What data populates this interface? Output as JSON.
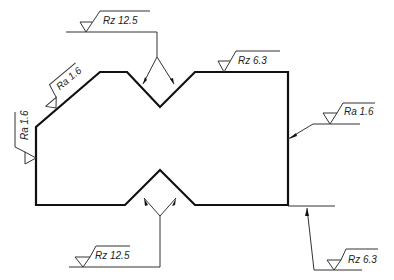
{
  "drawing": {
    "type": "surface roughness annotation drawing",
    "annotations": [
      {
        "id": "top-center",
        "label": "Rz 12.5"
      },
      {
        "id": "top-right-edge",
        "label": "Rz 6.3"
      },
      {
        "id": "left-chamfer",
        "label": "Ra 1.6"
      },
      {
        "id": "left-side",
        "label": "Ra 1.6"
      },
      {
        "id": "right-side",
        "label": "Ra 1.6"
      },
      {
        "id": "bottom-center",
        "label": "Rz 12.5"
      },
      {
        "id": "bottom-right",
        "label": "Rz 6.3"
      }
    ]
  }
}
